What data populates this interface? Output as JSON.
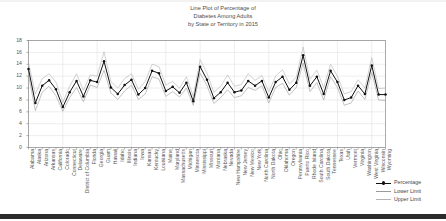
{
  "chart_data": {
    "type": "line",
    "title": "Line Plot of Percentage of\nDiabetes Among Adults\nby State or Territory in 2015",
    "xlabel": "",
    "ylabel": "",
    "ylim": [
      0,
      18
    ],
    "yticks": [
      0,
      2,
      4,
      6,
      8,
      10,
      12,
      14,
      16,
      18
    ],
    "grid": true,
    "legend_position": "lower right",
    "legend": [
      "Percentage",
      "Lower Limit",
      "Upper Limit"
    ],
    "colors": {
      "percentage": "#111111",
      "lower_limit": "#9a9a9a",
      "upper_limit": "#b4b4b4",
      "axis": "#888888",
      "grid": "#dddddd",
      "text": "#555555"
    },
    "categories": [
      "Alabama",
      "Alaska",
      "Arizona",
      "Arkansas",
      "California",
      "Colorado",
      "Connecticut",
      "Delaware",
      "District of Columbia",
      "Florida",
      "Georgia",
      "Guam",
      "Hawaii",
      "Idaho",
      "Illinois",
      "Indiana",
      "Iowa",
      "Kansas",
      "Kentucky",
      "Louisiana",
      "Maine",
      "Maryland",
      "Massachusetts",
      "Michigan",
      "Minnesota",
      "Mississippi",
      "Missouri",
      "Montana",
      "Nebraska",
      "Nevada",
      "New Hampshire",
      "New Jersey",
      "New Mexico",
      "New York",
      "North Carolina",
      "North Dakota",
      "Ohio",
      "Oklahoma",
      "Oregon",
      "Pennsylvania",
      "Puerto Rico",
      "Rhode Island",
      "South Carolina",
      "South Dakota",
      "Tennessee",
      "Texas",
      "Utah",
      "Vermont",
      "Virginia",
      "Washington",
      "West Virginia",
      "Wisconsin",
      "Wyoming"
    ],
    "series": [
      {
        "name": "Percentage",
        "values": [
          13.2,
          7.5,
          10.4,
          11.3,
          9.8,
          6.8,
          9.3,
          11.2,
          8.6,
          11.3,
          11.0,
          14.5,
          10.1,
          9.0,
          10.5,
          11.4,
          8.9,
          10.0,
          12.9,
          12.5,
          9.5,
          10.2,
          9.2,
          10.9,
          7.8,
          13.6,
          11.4,
          8.3,
          9.3,
          10.9,
          9.3,
          9.6,
          11.2,
          10.4,
          11.2,
          8.4,
          11.0,
          11.9,
          9.7,
          10.9,
          15.5,
          10.4,
          11.9,
          9.0,
          12.9,
          11.0,
          8.0,
          8.4,
          10.4,
          9.0,
          13.8,
          8.9,
          8.9
        ]
      },
      {
        "name": "Lower Limit",
        "values": [
          12.2,
          6.2,
          9.3,
          10.3,
          8.7,
          6.1,
          8.4,
          10.1,
          7.7,
          10.5,
          10.1,
          13.0,
          9.2,
          8.1,
          9.5,
          10.5,
          8.1,
          9.0,
          11.9,
          11.5,
          8.6,
          9.4,
          8.5,
          10.0,
          7.1,
          12.5,
          10.4,
          7.4,
          8.4,
          9.7,
          8.4,
          8.7,
          10.1,
          9.6,
          10.4,
          7.5,
          10.1,
          10.8,
          8.8,
          10.1,
          14.2,
          9.4,
          10.9,
          8.0,
          11.9,
          10.1,
          7.1,
          7.5,
          9.5,
          8.1,
          12.6,
          8.0,
          7.9
        ]
      },
      {
        "name": "Upper Limit",
        "values": [
          14.3,
          9.0,
          11.6,
          12.4,
          11.0,
          7.6,
          10.3,
          12.4,
          9.6,
          12.2,
          12.0,
          16.1,
          11.1,
          10.0,
          11.6,
          12.4,
          9.8,
          11.1,
          14.0,
          13.6,
          10.5,
          11.1,
          10.0,
          11.9,
          8.6,
          14.8,
          12.5,
          9.3,
          10.3,
          12.2,
          10.3,
          10.6,
          12.4,
          11.3,
          12.1,
          9.4,
          12.0,
          13.1,
          10.7,
          11.8,
          16.9,
          11.5,
          13.0,
          10.1,
          14.0,
          12.0,
          9.0,
          9.4,
          11.4,
          10.0,
          15.1,
          9.9,
          10.0
        ]
      }
    ]
  },
  "legend": {
    "items": [
      {
        "label": "Percentage"
      },
      {
        "label": "Lower Limit"
      },
      {
        "label": "Upper Limit"
      }
    ]
  }
}
